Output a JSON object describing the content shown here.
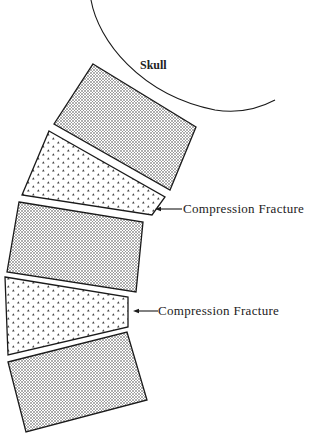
{
  "diagram": {
    "colors": {
      "background": "#ffffff",
      "ink": "#1a1a1a",
      "text": "#222222"
    },
    "skull": {
      "label": "Skull",
      "label_pos": [
        140,
        69
      ],
      "arc_path": "M91,0 C98,40 140,95 215,110 C240,114 260,108 275,100"
    },
    "vertebrae": [
      {
        "id": "v1",
        "pattern": "fine-dots",
        "state": "normal",
        "points": "93,64 196,127 170,190 54,124"
      },
      {
        "id": "v2",
        "pattern": "triangle-dots",
        "state": "compressed",
        "points": "49,131 165,197 152,215 22,195"
      },
      {
        "id": "v3",
        "pattern": "fine-dots",
        "state": "normal",
        "points": "19,202 143,222 136,292 7,272"
      },
      {
        "id": "v4",
        "pattern": "triangle-dots",
        "state": "compressed",
        "points": "5,277 128,297 128,327 8,355"
      },
      {
        "id": "v5",
        "pattern": "fine-dots",
        "state": "normal",
        "points": "8,362 127,332 147,400 26,432"
      }
    ],
    "annotations": [
      {
        "label": "Compression Fracture",
        "target": "v2",
        "arrow_from": [
          182,
          209
        ],
        "arrow_to": [
          155,
          209
        ],
        "text_pos": [
          183,
          213
        ]
      },
      {
        "label": "Compression Fracture",
        "target": "v4",
        "arrow_from": [
          158,
          311
        ],
        "arrow_to": [
          133,
          311
        ],
        "text_pos": [
          158,
          315
        ]
      }
    ]
  }
}
